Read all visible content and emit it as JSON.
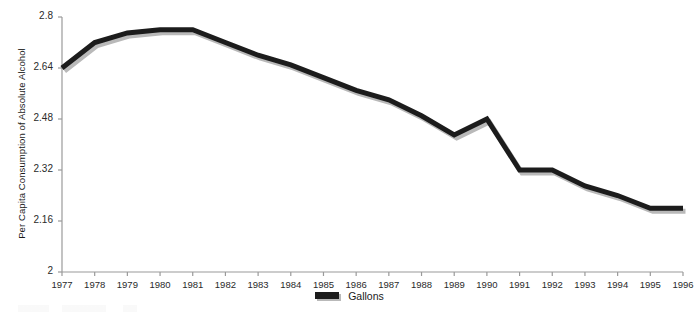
{
  "chart_data": {
    "type": "line",
    "title": "",
    "xlabel": "",
    "ylabel": "Per Capita Consumption of Absolute Alcohol",
    "x": [
      1977,
      1978,
      1979,
      1980,
      1981,
      1982,
      1983,
      1984,
      1985,
      1986,
      1987,
      1988,
      1989,
      1990,
      1991,
      1992,
      1993,
      1994,
      1995,
      1996
    ],
    "xtick_labels": [
      "1977",
      "1978",
      "1979",
      "1980",
      "1981",
      "1982",
      "1983",
      "1984",
      "1985",
      "1986",
      "1987",
      "1988",
      "1989",
      "1990",
      "1991",
      "1992",
      "1993",
      "1994",
      "1995",
      "1996"
    ],
    "ytick_labels": [
      "2.8",
      "2.64",
      "2.48",
      "2.32",
      "2.16",
      "2"
    ],
    "ytick_values": [
      2.8,
      2.64,
      2.48,
      2.32,
      2.16,
      2
    ],
    "ylim": [
      2,
      2.8
    ],
    "xlim": [
      1977,
      1996
    ],
    "grid": false,
    "legend_position": "bottom-center",
    "series": [
      {
        "name": "Gallons",
        "color": "#1c1c1c",
        "shadow_color": "#b9b9b9",
        "values": [
          2.64,
          2.72,
          2.75,
          2.76,
          2.76,
          2.72,
          2.68,
          2.65,
          2.61,
          2.57,
          2.54,
          2.49,
          2.43,
          2.48,
          2.32,
          2.32,
          2.27,
          2.24,
          2.2,
          2.2
        ]
      }
    ],
    "legend": [
      {
        "label": "Gallons",
        "color": "#1c1c1c"
      }
    ]
  },
  "axis": {
    "y_title": "Per Capita Consumption of Absolute Alcohol"
  },
  "legend": {
    "gallons_label": "Gallons"
  }
}
